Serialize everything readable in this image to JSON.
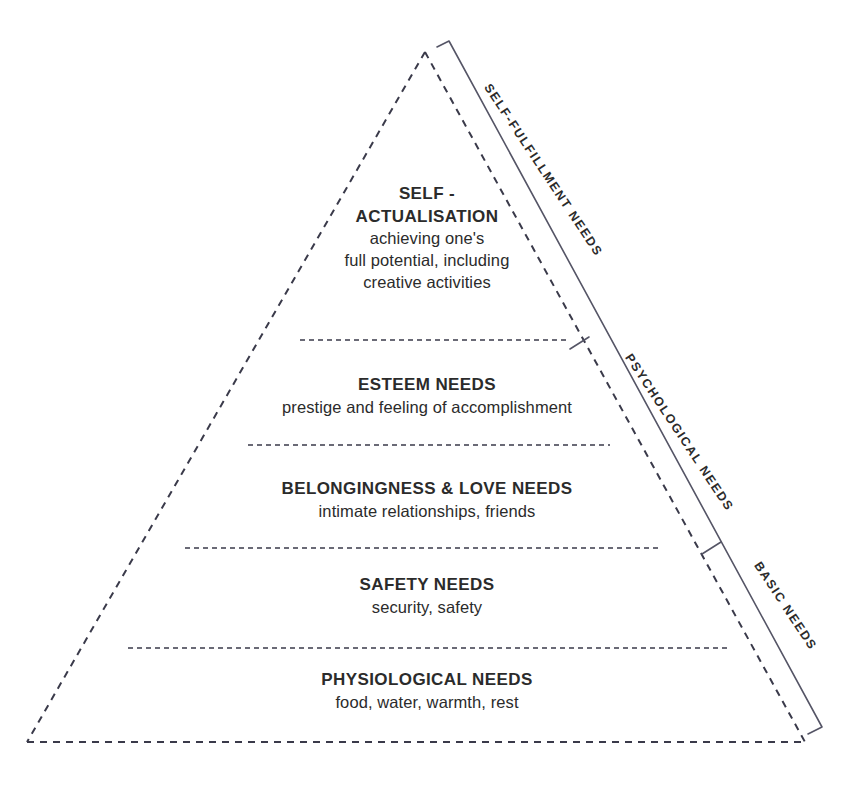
{
  "diagram": {
    "name": "maslow-hierarchy-of-needs-pyramid",
    "colors": {
      "background": "#ffffff",
      "text": "#2b2b2b",
      "pyramid_outline": "#3a3a4a",
      "divider": "#3a3a4a",
      "bracket": "#555566"
    },
    "tiers": [
      {
        "id": "self-actualisation",
        "title": "SELF -\nACTUALISATION",
        "description": "achieving one's\nfull potential, including\ncreative activities"
      },
      {
        "id": "esteem",
        "title": "ESTEEM NEEDS",
        "description": "prestige and feeling of accomplishment"
      },
      {
        "id": "belongingness",
        "title": "BELONGINGNESS & LOVE NEEDS",
        "description": "intimate relationships, friends"
      },
      {
        "id": "safety",
        "title": "SAFETY NEEDS",
        "description": "security, safety"
      },
      {
        "id": "physiological",
        "title": "PHYSIOLOGICAL NEEDS",
        "description": "food, water, warmth, rest"
      }
    ],
    "side_groups": [
      {
        "id": "self-fulfillment",
        "label": "SELF-FULFILLMENT NEEDS"
      },
      {
        "id": "psychological",
        "label": "PSYCHOLOGICAL NEEDS"
      },
      {
        "id": "basic",
        "label": "BASIC NEEDS"
      }
    ]
  }
}
